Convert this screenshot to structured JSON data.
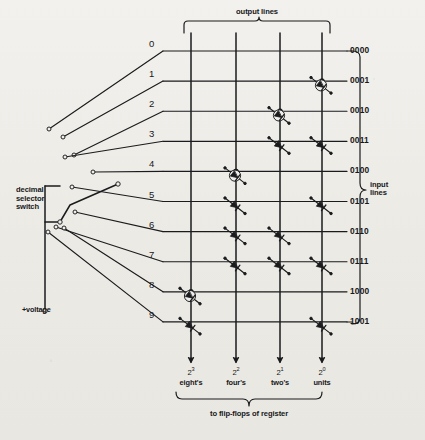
{
  "figure": {
    "title_alt": "Decimal-to-binary diode matrix encoder",
    "ink_color": "#1a1b1d",
    "paper_color": "#efeeea"
  },
  "annotations": {
    "output_lines": "output lines",
    "input_lines": "input\nlines",
    "decimal_selector_switch": "decimal\nselector\nswitch",
    "voltage": "+voltage",
    "register": "to flip-flops of register"
  },
  "decimal_inputs": {
    "label_note": "decimal selector switch positions",
    "digits": [
      "0",
      "1",
      "2",
      "3",
      "4",
      "5",
      "6",
      "7",
      "8",
      "9"
    ]
  },
  "binary_outputs": {
    "codes": [
      "0000",
      "0001",
      "0010",
      "0011",
      "0100",
      "0101",
      "0110",
      "0111",
      "1000",
      "1001"
    ]
  },
  "columns": [
    {
      "power": "2",
      "exponent": "3",
      "name": "eight's",
      "weight": 8
    },
    {
      "power": "2",
      "exponent": "2",
      "name": "four's",
      "weight": 4
    },
    {
      "power": "2",
      "exponent": "1",
      "name": "two's",
      "weight": 2
    },
    {
      "power": "2",
      "exponent": "0",
      "name": "units",
      "weight": 1
    }
  ],
  "matrix": {
    "note": "diode present where binary digit is 1; 'circled' marks a highlighted/magnified diode",
    "rows": [
      {
        "digit": "0",
        "code": "0000",
        "diodes": []
      },
      {
        "digit": "1",
        "code": "0001",
        "diodes": [
          {
            "col": 3,
            "circled": true
          }
        ]
      },
      {
        "digit": "2",
        "code": "0010",
        "diodes": [
          {
            "col": 2,
            "circled": true
          }
        ]
      },
      {
        "digit": "3",
        "code": "0011",
        "diodes": [
          {
            "col": 2,
            "circled": false
          },
          {
            "col": 3,
            "circled": false
          }
        ]
      },
      {
        "digit": "4",
        "code": "0100",
        "diodes": [
          {
            "col": 1,
            "circled": true
          }
        ]
      },
      {
        "digit": "5",
        "code": "0101",
        "diodes": [
          {
            "col": 1,
            "circled": false
          },
          {
            "col": 3,
            "circled": false
          }
        ]
      },
      {
        "digit": "6",
        "code": "0110",
        "diodes": [
          {
            "col": 1,
            "circled": false
          },
          {
            "col": 2,
            "circled": false
          }
        ]
      },
      {
        "digit": "7",
        "code": "0111",
        "diodes": [
          {
            "col": 1,
            "circled": false
          },
          {
            "col": 2,
            "circled": false
          },
          {
            "col": 3,
            "circled": false
          }
        ]
      },
      {
        "digit": "8",
        "code": "1000",
        "diodes": [
          {
            "col": 0,
            "circled": true
          }
        ]
      },
      {
        "digit": "9",
        "code": "1001",
        "diodes": [
          {
            "col": 0,
            "circled": false
          },
          {
            "col": 3,
            "circled": false
          }
        ]
      }
    ]
  }
}
